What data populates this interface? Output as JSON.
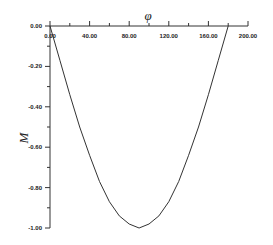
{
  "chart_data": {
    "type": "line",
    "title": "",
    "xlabel": "φ",
    "ylabel": "M",
    "xlim": [
      0,
      200
    ],
    "ylim": [
      -1.0,
      0.0
    ],
    "grid": false,
    "legend": null,
    "x_ticks": [
      "0.00",
      "40.00",
      "80.00",
      "120.00",
      "160.00",
      "200.00"
    ],
    "y_ticks": [
      "0.00",
      "-0.20",
      "-0.40",
      "-0.60",
      "-0.80",
      "-1.00"
    ],
    "series": [
      {
        "name": "M(φ)",
        "color": "#333333",
        "x": [
          0,
          10,
          20,
          30,
          40,
          50,
          60,
          70,
          80,
          90,
          100,
          110,
          120,
          130,
          140,
          150,
          160,
          170,
          180
        ],
        "y": [
          0.0,
          -0.17,
          -0.34,
          -0.5,
          -0.64,
          -0.77,
          -0.87,
          -0.94,
          -0.98,
          -1.0,
          -0.98,
          -0.94,
          -0.87,
          -0.77,
          -0.64,
          -0.5,
          -0.34,
          -0.17,
          0.0
        ]
      }
    ]
  }
}
